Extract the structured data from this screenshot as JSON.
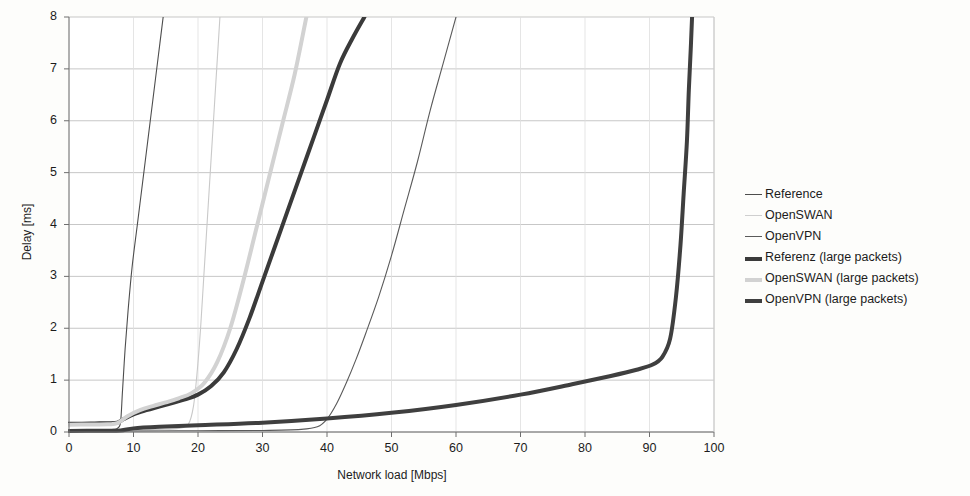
{
  "chart_data": {
    "type": "line",
    "title": "",
    "xlabel": "Network load [Mbps]",
    "ylabel": "Delay [ms]",
    "xlim": [
      0,
      100
    ],
    "ylim": [
      0,
      8
    ],
    "xticks": [
      0,
      10,
      20,
      30,
      40,
      50,
      60,
      70,
      80,
      90,
      100
    ],
    "yticks": [
      0,
      1,
      2,
      3,
      4,
      5,
      6,
      7,
      8
    ],
    "grid": "horizontal-and-vertical-light",
    "legend_position": "right-outside",
    "series": [
      {
        "name": "Reference",
        "color": "#4d4d4d",
        "width": 1.1,
        "points": [
          [
            0,
            0.03
          ],
          [
            2,
            0.03
          ],
          [
            4,
            0.035
          ],
          [
            6,
            0.04
          ],
          [
            7,
            0.05
          ],
          [
            7.6,
            0.08
          ],
          [
            8,
            0.2
          ],
          [
            8.3,
            0.8
          ],
          [
            8.7,
            1.6
          ],
          [
            9.2,
            2.4
          ],
          [
            9.8,
            3.2
          ],
          [
            10.6,
            4.0
          ],
          [
            11.4,
            4.8
          ],
          [
            12.2,
            5.6
          ],
          [
            13.0,
            6.4
          ],
          [
            13.8,
            7.2
          ],
          [
            14.6,
            8.0
          ]
        ]
      },
      {
        "name": "OpenSWAN",
        "color": "#c9c9c9",
        "width": 1.1,
        "points": [
          [
            0,
            0.03
          ],
          [
            5,
            0.035
          ],
          [
            10,
            0.04
          ],
          [
            14,
            0.05
          ],
          [
            17,
            0.07
          ],
          [
            18.5,
            0.15
          ],
          [
            19.3,
            0.5
          ],
          [
            19.9,
            1.2
          ],
          [
            20.4,
            2.0
          ],
          [
            20.9,
            3.0
          ],
          [
            21.4,
            4.0
          ],
          [
            21.9,
            5.0
          ],
          [
            22.4,
            6.0
          ],
          [
            22.9,
            7.0
          ],
          [
            23.4,
            8.0
          ]
        ]
      },
      {
        "name": "OpenVPN",
        "color": "#5a5a5a",
        "width": 1.1,
        "points": [
          [
            0,
            0.02
          ],
          [
            10,
            0.02
          ],
          [
            20,
            0.025
          ],
          [
            30,
            0.03
          ],
          [
            36,
            0.05
          ],
          [
            38.5,
            0.1
          ],
          [
            40,
            0.25
          ],
          [
            41.5,
            0.55
          ],
          [
            43,
            0.95
          ],
          [
            44.5,
            1.4
          ],
          [
            46,
            1.9
          ],
          [
            48,
            2.6
          ],
          [
            50,
            3.4
          ],
          [
            52,
            4.3
          ],
          [
            54,
            5.2
          ],
          [
            56,
            6.2
          ],
          [
            58,
            7.1
          ],
          [
            60,
            8.0
          ]
        ]
      },
      {
        "name": "Referenz (large packets)",
        "color": "#3a3a3a",
        "width": 4.0,
        "points": [
          [
            0,
            0.16
          ],
          [
            2,
            0.16
          ],
          [
            4,
            0.165
          ],
          [
            6,
            0.17
          ],
          [
            7.5,
            0.18
          ],
          [
            8.5,
            0.25
          ],
          [
            10,
            0.34
          ],
          [
            12,
            0.42
          ],
          [
            14,
            0.49
          ],
          [
            16,
            0.56
          ],
          [
            18,
            0.63
          ],
          [
            20,
            0.72
          ],
          [
            22,
            0.88
          ],
          [
            24,
            1.15
          ],
          [
            26,
            1.6
          ],
          [
            28,
            2.2
          ],
          [
            30,
            2.9
          ],
          [
            32,
            3.6
          ],
          [
            34,
            4.3
          ],
          [
            36,
            5.0
          ],
          [
            38,
            5.7
          ],
          [
            40,
            6.4
          ],
          [
            42,
            7.1
          ],
          [
            44,
            7.6
          ],
          [
            45.8,
            8.0
          ]
        ]
      },
      {
        "name": "OpenSWAN (large packets)",
        "color": "#d2d2d2",
        "width": 4.0,
        "points": [
          [
            0,
            0.14
          ],
          [
            3,
            0.145
          ],
          [
            6,
            0.15
          ],
          [
            7.5,
            0.17
          ],
          [
            9,
            0.3
          ],
          [
            11,
            0.42
          ],
          [
            13,
            0.5
          ],
          [
            15,
            0.57
          ],
          [
            17,
            0.65
          ],
          [
            19,
            0.75
          ],
          [
            21,
            0.95
          ],
          [
            23,
            1.35
          ],
          [
            25,
            2.0
          ],
          [
            27,
            2.9
          ],
          [
            29,
            3.9
          ],
          [
            31,
            4.9
          ],
          [
            33,
            5.9
          ],
          [
            35,
            6.9
          ],
          [
            36.8,
            8.0
          ]
        ]
      },
      {
        "name": "OpenVPN (large packets)",
        "color": "#3f3f3f",
        "width": 4.0,
        "points": [
          [
            0,
            0.02
          ],
          [
            5,
            0.025
          ],
          [
            8,
            0.03
          ],
          [
            10,
            0.07
          ],
          [
            14,
            0.1
          ],
          [
            20,
            0.13
          ],
          [
            30,
            0.18
          ],
          [
            40,
            0.26
          ],
          [
            50,
            0.37
          ],
          [
            60,
            0.52
          ],
          [
            70,
            0.72
          ],
          [
            78,
            0.92
          ],
          [
            84,
            1.08
          ],
          [
            88,
            1.2
          ],
          [
            90.5,
            1.3
          ],
          [
            92,
            1.45
          ],
          [
            93.2,
            1.8
          ],
          [
            94.1,
            2.6
          ],
          [
            94.8,
            3.6
          ],
          [
            95.3,
            4.6
          ],
          [
            95.8,
            5.6
          ],
          [
            96.1,
            6.6
          ],
          [
            96.4,
            7.4
          ],
          [
            96.6,
            8.0
          ]
        ]
      }
    ]
  },
  "legend": {
    "items": [
      {
        "label": "Reference",
        "color": "#4d4d4d",
        "thickness": "1px"
      },
      {
        "label": "OpenSWAN",
        "color": "#cfcfcf",
        "thickness": "1px"
      },
      {
        "label": "OpenVPN",
        "color": "#5a5a5a",
        "thickness": "1px"
      },
      {
        "label": "Referenz (large packets)",
        "color": "#3a3a3a",
        "thickness": "4px"
      },
      {
        "label": "OpenSWAN (large packets)",
        "color": "#d2d2d2",
        "thickness": "4px"
      },
      {
        "label": "OpenVPN (large packets)",
        "color": "#3f3f3f",
        "thickness": "4px"
      }
    ]
  },
  "axes": {
    "x_title": "Network load [Mbps]",
    "y_title": "Delay [ms]",
    "x_tick_labels": [
      "0",
      "10",
      "20",
      "30",
      "40",
      "50",
      "60",
      "70",
      "80",
      "90",
      "100"
    ],
    "y_tick_labels": [
      "0",
      "1",
      "2",
      "3",
      "4",
      "5",
      "6",
      "7",
      "8"
    ]
  },
  "style": {
    "background": "#fdfdfb",
    "gridline_color": "#b9b9b9",
    "axis_color": "#6e6e6e",
    "text_color": "#1c1c1c"
  }
}
